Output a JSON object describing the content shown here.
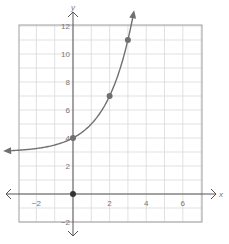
{
  "chart_data": {
    "type": "line",
    "title": "",
    "xlabel": "x",
    "ylabel": "y",
    "function": "y = 2^x + 3",
    "xlim": [
      -3.5,
      7
    ],
    "ylim": [
      -2,
      12
    ],
    "grid": true,
    "x_ticks": [
      -2,
      2,
      4,
      6
    ],
    "y_ticks": [
      12,
      10,
      8,
      6,
      4,
      2,
      -2
    ],
    "x_tick_labels": [
      "−2",
      "2",
      "4",
      "6"
    ],
    "y_tick_labels": [
      "12",
      "10",
      "8",
      "6",
      "4",
      "2",
      "−2"
    ],
    "points": [
      {
        "x": 0,
        "y": 4
      },
      {
        "x": 2,
        "y": 7
      },
      {
        "x": 3,
        "y": 11
      }
    ],
    "origin_marker": {
      "x": 0,
      "y": 0
    },
    "asymptote": 3,
    "curve_x_range": [
      -3.6,
      3.3
    ]
  },
  "colors": {
    "grid": "#d9d9d9",
    "border": "#a0a0a0",
    "axis": "#555555",
    "curve": "#707070",
    "point": "#707070",
    "origin": "#333333"
  },
  "layout": {
    "x0_px": 73,
    "y0_px": 194,
    "px_per_x": 18.3,
    "px_per_y": 14,
    "grid_left": 19,
    "grid_right": 202,
    "grid_top": 25,
    "grid_bottom": 222
  }
}
